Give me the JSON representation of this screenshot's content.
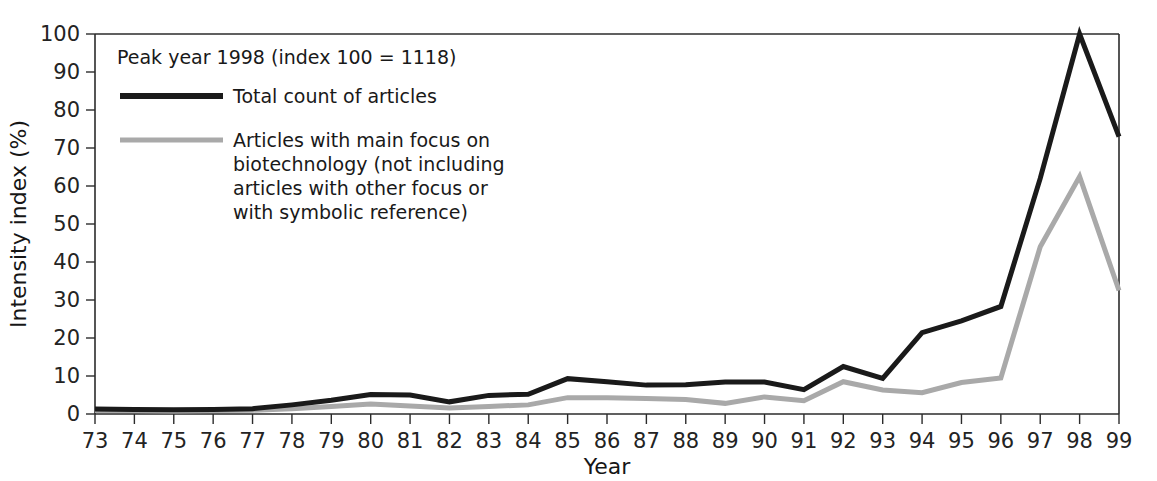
{
  "chart_data": {
    "type": "line",
    "title": "",
    "xlabel": "Year",
    "ylabel": "Intensity index (%)",
    "xlim": [
      73,
      99
    ],
    "ylim": [
      0,
      100
    ],
    "ytick_step": 10,
    "yticks": [
      0,
      10,
      20,
      30,
      40,
      50,
      60,
      70,
      80,
      90,
      100
    ],
    "grid": false,
    "legend_position": "upper-left-inside",
    "annotation": "Peak year 1998 (index 100 = 1118)",
    "categories": [
      "73",
      "74",
      "75",
      "76",
      "77",
      "78",
      "79",
      "80",
      "81",
      "82",
      "83",
      "84",
      "85",
      "86",
      "87",
      "88",
      "89",
      "90",
      "91",
      "92",
      "93",
      "94",
      "95",
      "96",
      "97",
      "98",
      "99"
    ],
    "x": [
      73,
      74,
      75,
      76,
      77,
      78,
      79,
      80,
      81,
      82,
      83,
      84,
      85,
      86,
      87,
      88,
      89,
      90,
      91,
      92,
      93,
      94,
      95,
      96,
      97,
      98,
      99
    ],
    "series": [
      {
        "name": "Total count of articles",
        "color": "#1a1a1a",
        "width": 5,
        "values": [
          1.3,
          1.2,
          1.1,
          1.2,
          1.4,
          2.4,
          3.6,
          5.1,
          5.0,
          3.2,
          4.9,
          5.2,
          9.3,
          8.5,
          7.6,
          7.7,
          8.4,
          8.4,
          6.4,
          12.5,
          9.4,
          21.4,
          24.5,
          28.3,
          62.0,
          100.0,
          73.0
        ]
      },
      {
        "name": "Articles with main focus on biotechnology (not including articles with other focus or with symbolic reference)",
        "color": "#a9a9a9",
        "width": 5,
        "values": [
          0.9,
          0.9,
          0.8,
          0.9,
          1.0,
          1.4,
          2.0,
          2.6,
          2.1,
          1.6,
          2.0,
          2.4,
          4.3,
          4.3,
          4.1,
          3.8,
          2.8,
          4.5,
          3.5,
          8.5,
          6.3,
          5.6,
          8.3,
          9.5,
          44.0,
          62.5,
          32.5
        ]
      }
    ]
  },
  "legend": {
    "note": "Peak year 1998 (index 100 = 1118)",
    "entries": [
      {
        "label": "Total count of articles",
        "color": "#1a1a1a"
      },
      {
        "label_lines": [
          "Articles with main focus on",
          "biotechnology (not including",
          "articles with other focus or",
          "with symbolic reference)"
        ],
        "color": "#a9a9a9"
      }
    ],
    "entry2_line1": "Articles with main focus on",
    "entry2_line2": "biotechnology (not including",
    "entry2_line3": "articles with other focus or",
    "entry2_line4": "with symbolic reference)"
  }
}
